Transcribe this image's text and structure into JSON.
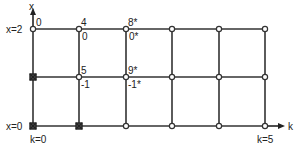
{
  "diagram": {
    "axes": {
      "vertical_label": "x",
      "horizontal_label": "k"
    },
    "grid": {
      "columns_px": [
        33,
        79,
        126,
        172,
        219,
        265
      ],
      "rows_px": [
        29,
        77,
        126
      ],
      "line_color": "#333333"
    },
    "row_labels": {
      "top": "x=2",
      "bottom": "x=0"
    },
    "column_labels": {
      "left": "k=0",
      "right": "k=5"
    },
    "node_values": {
      "n_0_2_top": "0",
      "n_1_2_top": "4",
      "n_1_2_bottom": "0",
      "n_2_2_top": "8*",
      "n_2_2_bottom": "0*",
      "n_1_1_top": "5",
      "n_1_1_bottom": "-1",
      "n_2_1_top": "9*",
      "n_2_1_bottom": "-1*"
    },
    "boundary_nodes": [
      "k=0,x=1",
      "k=0,x=0",
      "k=1,x=0"
    ]
  }
}
